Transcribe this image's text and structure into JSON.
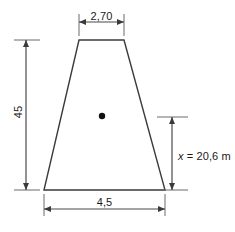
{
  "figure": {
    "type": "engineering-dimension-diagram",
    "shape": "trapezoid",
    "background_color": "#ffffff",
    "line_color": "#3a3a3a",
    "text_color": "#1a1a1a",
    "dimensions": {
      "top_width": {
        "label": "2,70",
        "value": 2.7,
        "position": "top",
        "orientation": "horizontal"
      },
      "bottom_width": {
        "label": "4,5",
        "value": 4.5,
        "position": "bottom",
        "orientation": "horizontal"
      },
      "height": {
        "label": "45",
        "value": 45,
        "position": "left",
        "orientation": "vertical-rotated"
      },
      "centroid_distance": {
        "symbol": "x",
        "equals": "=",
        "value": "20,6 m",
        "full_label": "x = 20,6 m",
        "position": "right",
        "orientation": "horizontal"
      }
    },
    "centroid_marker": {
      "name": "centroid-dot",
      "shape": "filled-circle",
      "color": "#111111"
    }
  }
}
